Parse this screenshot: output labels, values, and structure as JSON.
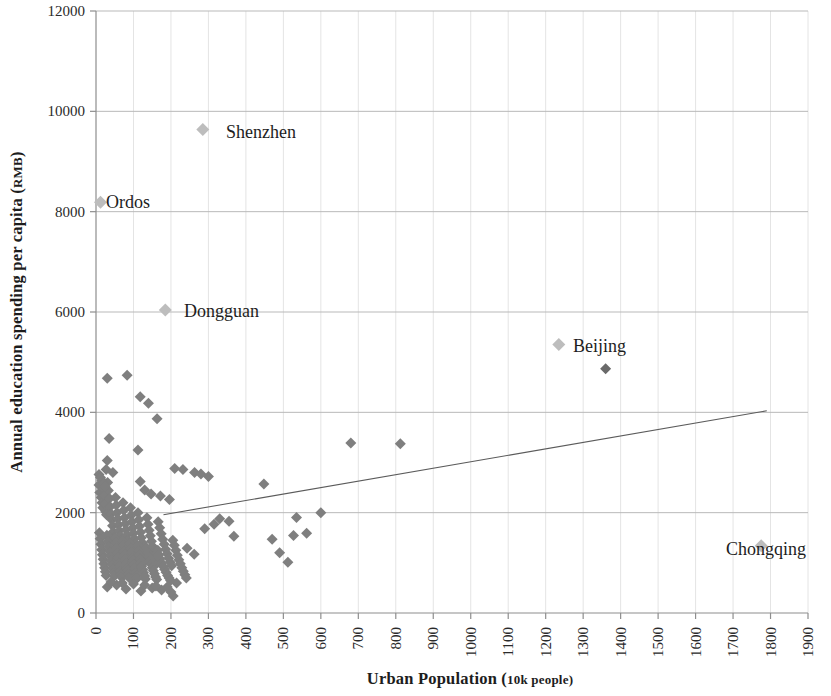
{
  "chart_data": {
    "type": "scatter",
    "title": "",
    "xlabel": "Urban Population (10k people)",
    "xlabel_main": "Urban Population (",
    "xlabel_unit": "10k people)",
    "ylabel": "Annual education spending per capita (RMB)",
    "ylabel_main": "Annual education spending per capita (",
    "ylabel_unit": "RMB",
    "ylabel_tail": ")",
    "xlim": [
      0,
      1900
    ],
    "ylim": [
      0,
      12000
    ],
    "xtick_step": 100,
    "ytick_step": 2000,
    "xticks": [
      "0",
      "100",
      "200",
      "300",
      "400",
      "500",
      "600",
      "700",
      "800",
      "900",
      "1000",
      "1100",
      "1200",
      "1300",
      "1400",
      "1500",
      "1600",
      "1700",
      "1800",
      "1900"
    ],
    "yticks": [
      "0",
      "2000",
      "4000",
      "6000",
      "8000",
      "10000",
      "12000"
    ],
    "grid": {
      "vertical": true,
      "horizontal": true,
      "v_color": "#e4e4e4",
      "h_color": "#b9b9b9"
    },
    "legend": {
      "visible": false,
      "position": "none"
    },
    "marker": {
      "shape": "diamond",
      "size": 11,
      "color": "#7f7f7f",
      "highlight_color": "#bdbdbd",
      "dark_color": "#6a6a6a"
    },
    "trendline": {
      "visible": true,
      "color": "#5b5b5b",
      "x_start": 180,
      "y_start": 1960,
      "x_end": 1790,
      "y_end": 4030
    },
    "annotations": [
      {
        "label": "Shenzhen",
        "x": 285,
        "y": 9640,
        "style": "highlight"
      },
      {
        "label": "Ordos",
        "x": 12,
        "y": 8190,
        "style": "highlight"
      },
      {
        "label": "Dongguan",
        "x": 185,
        "y": 6040,
        "style": "highlight"
      },
      {
        "label": "Beijing",
        "x": 1235,
        "y": 5350,
        "style": "highlight"
      },
      {
        "label": "Chongqing",
        "x": 1775,
        "y": 1340,
        "style": "highlight"
      }
    ],
    "notable_points": [
      {
        "x": 1360,
        "y": 4870,
        "style": "dark"
      },
      {
        "x": 680,
        "y": 3390,
        "style": "normal"
      },
      {
        "x": 812,
        "y": 3375,
        "style": "normal"
      },
      {
        "x": 600,
        "y": 2000,
        "style": "normal"
      },
      {
        "x": 448,
        "y": 2570,
        "style": "normal"
      },
      {
        "x": 562,
        "y": 1590,
        "style": "normal"
      },
      {
        "x": 535,
        "y": 1905,
        "style": "normal"
      },
      {
        "x": 512,
        "y": 1010,
        "style": "normal"
      },
      {
        "x": 470,
        "y": 1470,
        "style": "normal"
      },
      {
        "x": 527,
        "y": 1545,
        "style": "normal"
      }
    ],
    "series": [
      {
        "name": "Chinese cities",
        "points": [
          [
            12,
            8190
          ],
          [
            285,
            9640
          ],
          [
            185,
            6040
          ],
          [
            1235,
            5350
          ],
          [
            1360,
            4870
          ],
          [
            1775,
            1340
          ],
          [
            30,
            4680
          ],
          [
            83,
            4740
          ],
          [
            118,
            4310
          ],
          [
            140,
            4180
          ],
          [
            163,
            3870
          ],
          [
            35,
            3480
          ],
          [
            112,
            3250
          ],
          [
            30,
            3040
          ],
          [
            27,
            2860
          ],
          [
            45,
            2800
          ],
          [
            210,
            2880
          ],
          [
            232,
            2860
          ],
          [
            263,
            2800
          ],
          [
            280,
            2770
          ],
          [
            300,
            2720
          ],
          [
            118,
            2620
          ],
          [
            130,
            2450
          ],
          [
            147,
            2370
          ],
          [
            172,
            2330
          ],
          [
            196,
            2260
          ],
          [
            448,
            2570
          ],
          [
            680,
            3390
          ],
          [
            812,
            3375
          ],
          [
            600,
            2000
          ],
          [
            330,
            1880
          ],
          [
            355,
            1830
          ],
          [
            315,
            1770
          ],
          [
            290,
            1680
          ],
          [
            368,
            1530
          ],
          [
            470,
            1470
          ],
          [
            527,
            1545
          ],
          [
            562,
            1590
          ],
          [
            535,
            1905
          ],
          [
            512,
            1010
          ],
          [
            490,
            1200
          ],
          [
            262,
            1170
          ],
          [
            243,
            1290
          ],
          [
            8,
            2550
          ],
          [
            10,
            2400
          ],
          [
            14,
            2300
          ],
          [
            16,
            2200
          ],
          [
            18,
            2100
          ],
          [
            20,
            2480
          ],
          [
            22,
            2340
          ],
          [
            24,
            2180
          ],
          [
            26,
            2020
          ],
          [
            28,
            1960
          ],
          [
            31,
            2600
          ],
          [
            33,
            2440
          ],
          [
            36,
            2280
          ],
          [
            38,
            2120
          ],
          [
            40,
            1980
          ],
          [
            42,
            1860
          ],
          [
            44,
            1740
          ],
          [
            46,
            1620
          ],
          [
            48,
            1500
          ],
          [
            50,
            1400
          ],
          [
            52,
            2300
          ],
          [
            54,
            2150
          ],
          [
            56,
            2000
          ],
          [
            58,
            1880
          ],
          [
            60,
            1760
          ],
          [
            62,
            1640
          ],
          [
            64,
            1540
          ],
          [
            66,
            1440
          ],
          [
            68,
            1340
          ],
          [
            70,
            1250
          ],
          [
            72,
            2200
          ],
          [
            74,
            2050
          ],
          [
            76,
            1900
          ],
          [
            78,
            1780
          ],
          [
            80,
            1660
          ],
          [
            82,
            1550
          ],
          [
            84,
            1450
          ],
          [
            86,
            1350
          ],
          [
            88,
            1260
          ],
          [
            90,
            1170
          ],
          [
            92,
            2100
          ],
          [
            94,
            1950
          ],
          [
            96,
            1820
          ],
          [
            98,
            1700
          ],
          [
            100,
            1590
          ],
          [
            102,
            1480
          ],
          [
            104,
            1380
          ],
          [
            106,
            1290
          ],
          [
            108,
            1200
          ],
          [
            110,
            1110
          ],
          [
            112,
            2000
          ],
          [
            114,
            1860
          ],
          [
            116,
            1730
          ],
          [
            119,
            1610
          ],
          [
            121,
            1500
          ],
          [
            124,
            1400
          ],
          [
            126,
            1300
          ],
          [
            128,
            1210
          ],
          [
            131,
            1120
          ],
          [
            133,
            1040
          ],
          [
            136,
            1900
          ],
          [
            139,
            1770
          ],
          [
            142,
            1650
          ],
          [
            145,
            1540
          ],
          [
            148,
            1430
          ],
          [
            151,
            1330
          ],
          [
            154,
            1240
          ],
          [
            157,
            1150
          ],
          [
            160,
            1070
          ],
          [
            163,
            990
          ],
          [
            166,
            1820
          ],
          [
            170,
            1700
          ],
          [
            174,
            1580
          ],
          [
            178,
            1470
          ],
          [
            182,
            1370
          ],
          [
            186,
            1270
          ],
          [
            190,
            1180
          ],
          [
            194,
            1090
          ],
          [
            198,
            1010
          ],
          [
            202,
            940
          ],
          [
            9,
            1600
          ],
          [
            11,
            1480
          ],
          [
            13,
            1370
          ],
          [
            15,
            1260
          ],
          [
            17,
            1160
          ],
          [
            19,
            1070
          ],
          [
            21,
            980
          ],
          [
            23,
            900
          ],
          [
            25,
            820
          ],
          [
            27,
            750
          ],
          [
            29,
            1550
          ],
          [
            32,
            1430
          ],
          [
            34,
            1320
          ],
          [
            37,
            1220
          ],
          [
            39,
            1130
          ],
          [
            41,
            1040
          ],
          [
            43,
            960
          ],
          [
            45,
            880
          ],
          [
            47,
            810
          ],
          [
            49,
            740
          ],
          [
            51,
            1500
          ],
          [
            53,
            1390
          ],
          [
            55,
            1280
          ],
          [
            57,
            1180
          ],
          [
            59,
            1090
          ],
          [
            61,
            1000
          ],
          [
            63,
            920
          ],
          [
            65,
            850
          ],
          [
            67,
            780
          ],
          [
            69,
            710
          ],
          [
            71,
            1450
          ],
          [
            73,
            1340
          ],
          [
            75,
            1240
          ],
          [
            77,
            1150
          ],
          [
            79,
            1060
          ],
          [
            81,
            980
          ],
          [
            83,
            900
          ],
          [
            85,
            830
          ],
          [
            87,
            760
          ],
          [
            89,
            700
          ],
          [
            91,
            1400
          ],
          [
            93,
            1300
          ],
          [
            95,
            1200
          ],
          [
            97,
            1110
          ],
          [
            99,
            1030
          ],
          [
            101,
            950
          ],
          [
            103,
            880
          ],
          [
            105,
            810
          ],
          [
            107,
            750
          ],
          [
            109,
            690
          ],
          [
            111,
            1350
          ],
          [
            113,
            1250
          ],
          [
            115,
            1160
          ],
          [
            117,
            1080
          ],
          [
            120,
            1000
          ],
          [
            122,
            930
          ],
          [
            125,
            860
          ],
          [
            127,
            800
          ],
          [
            130,
            740
          ],
          [
            132,
            680
          ],
          [
            135,
            1300
          ],
          [
            138,
            1200
          ],
          [
            141,
            1120
          ],
          [
            144,
            1040
          ],
          [
            147,
            970
          ],
          [
            150,
            900
          ],
          [
            153,
            840
          ],
          [
            156,
            780
          ],
          [
            159,
            720
          ],
          [
            162,
            670
          ],
          [
            165,
            1250
          ],
          [
            168,
            1160
          ],
          [
            171,
            1080
          ],
          [
            175,
            1000
          ],
          [
            179,
            930
          ],
          [
            183,
            870
          ],
          [
            187,
            810
          ],
          [
            191,
            750
          ],
          [
            195,
            700
          ],
          [
            199,
            650
          ],
          [
            205,
            1450
          ],
          [
            209,
            1350
          ],
          [
            213,
            1250
          ],
          [
            217,
            1150
          ],
          [
            221,
            1060
          ],
          [
            225,
            980
          ],
          [
            229,
            900
          ],
          [
            233,
            830
          ],
          [
            237,
            760
          ],
          [
            241,
            700
          ],
          [
            206,
            340
          ],
          [
            30,
            520
          ],
          [
            55,
            560
          ],
          [
            80,
            480
          ],
          [
            120,
            440
          ],
          [
            150,
            500
          ],
          [
            175,
            460
          ],
          [
            200,
            420
          ],
          [
            40,
            620
          ],
          [
            70,
            600
          ],
          [
            100,
            580
          ],
          [
            130,
            560
          ],
          [
            160,
            540
          ],
          [
            190,
            520
          ],
          [
            215,
            600
          ],
          [
            8,
            2760
          ],
          [
            12,
            2700
          ],
          [
            16,
            2640
          ],
          [
            20,
            2580
          ],
          [
            24,
            2520
          ]
        ]
      }
    ]
  },
  "geometry": {
    "plot_left": 96,
    "plot_right": 808,
    "plot_top": 11,
    "plot_bottom": 613
  },
  "label_positions": {
    "Shenzhen": {
      "text_x": 226,
      "text_y": 138
    },
    "Ordos": {
      "text_x": 106,
      "text_y": 208
    },
    "Dongguan": {
      "text_x": 184,
      "text_y": 317
    },
    "Beijing": {
      "text_x": 573,
      "text_y": 352
    },
    "Chongqing": {
      "text_x": 726,
      "text_y": 555
    }
  },
  "axis_titles": {
    "x": "Urban Population (10k people)",
    "y": "Annual education spending per capita (RMB)"
  }
}
